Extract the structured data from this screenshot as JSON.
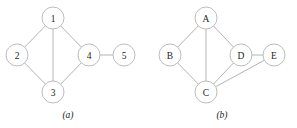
{
  "figure": {
    "width": 297,
    "height": 128,
    "background": "#ffffff",
    "edge_color": "#b4b4b4",
    "node_stroke_color": "#bdbdbd",
    "node_fill_color": "#ffffff",
    "label_color": "#1c1c1c",
    "node_radius": 11
  },
  "chart_data": {
    "type": "diagram",
    "subtype": "undirected-graph",
    "title": "",
    "panels": [
      {
        "id": "a",
        "caption": "(a)",
        "caption_x": 68,
        "caption_y": 116,
        "nodes": [
          {
            "id": "1",
            "label": "1",
            "x": 53,
            "y": 18
          },
          {
            "id": "2",
            "label": "2",
            "x": 17,
            "y": 55
          },
          {
            "id": "3",
            "label": "3",
            "x": 53,
            "y": 92
          },
          {
            "id": "4",
            "label": "4",
            "x": 89,
            "y": 55
          },
          {
            "id": "5",
            "label": "5",
            "x": 124,
            "y": 55
          }
        ],
        "edges": [
          {
            "from": "1",
            "to": "2"
          },
          {
            "from": "1",
            "to": "3"
          },
          {
            "from": "1",
            "to": "4"
          },
          {
            "from": "2",
            "to": "3"
          },
          {
            "from": "3",
            "to": "4"
          },
          {
            "from": "4",
            "to": "5"
          }
        ]
      },
      {
        "id": "b",
        "caption": "(b)",
        "caption_x": 222,
        "caption_y": 116,
        "nodes": [
          {
            "id": "A",
            "label": "A",
            "x": 206,
            "y": 18
          },
          {
            "id": "B",
            "label": "B",
            "x": 170,
            "y": 55
          },
          {
            "id": "C",
            "label": "C",
            "x": 206,
            "y": 92
          },
          {
            "id": "D",
            "label": "D",
            "x": 241,
            "y": 55
          },
          {
            "id": "E",
            "label": "E",
            "x": 274,
            "y": 55
          }
        ],
        "edges": [
          {
            "from": "A",
            "to": "B"
          },
          {
            "from": "A",
            "to": "C"
          },
          {
            "from": "A",
            "to": "D"
          },
          {
            "from": "B",
            "to": "C"
          },
          {
            "from": "C",
            "to": "D"
          },
          {
            "from": "C",
            "to": "E"
          },
          {
            "from": "D",
            "to": "E"
          }
        ]
      }
    ]
  }
}
